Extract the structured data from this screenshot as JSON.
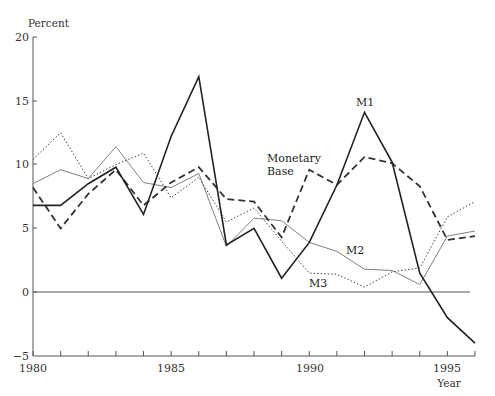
{
  "chart_data": {
    "type": "line",
    "title": "",
    "xlabel": "Year",
    "ylabel": "Percent",
    "xlim": [
      1980,
      1996
    ],
    "ylim": [
      -5,
      20
    ],
    "x_ticks": [
      1980,
      1985,
      1990,
      1995
    ],
    "y_ticks": [
      -5,
      0,
      5,
      10,
      15,
      20
    ],
    "grid": false,
    "legend": "inline labels",
    "x": [
      1980,
      1981,
      1982,
      1983,
      1984,
      1985,
      1986,
      1987,
      1988,
      1989,
      1990,
      1991,
      1992,
      1993,
      1994,
      1995,
      1996
    ],
    "series": [
      {
        "name": "M1",
        "style": "solid-thick",
        "values": [
          6.8,
          6.8,
          8.5,
          9.8,
          6.1,
          12.2,
          16.9,
          3.7,
          5.0,
          1.1,
          3.9,
          8.4,
          14.1,
          10.2,
          1.5,
          -2.0,
          -4.0
        ]
      },
      {
        "name": "M2",
        "style": "solid-thin",
        "values": [
          8.5,
          9.6,
          8.9,
          11.4,
          8.6,
          8.2,
          9.3,
          3.6,
          5.8,
          5.6,
          3.9,
          3.2,
          1.8,
          1.7,
          0.6,
          4.4,
          4.8
        ]
      },
      {
        "name": "M3",
        "style": "dotted",
        "values": [
          10.4,
          12.5,
          8.9,
          10.0,
          10.9,
          7.4,
          9.0,
          5.5,
          6.6,
          4.0,
          1.5,
          1.4,
          0.4,
          1.6,
          1.9,
          5.9,
          7.1
        ]
      },
      {
        "name": "Monetary Base",
        "style": "dashed",
        "values": [
          8.2,
          5.0,
          7.7,
          9.6,
          6.8,
          8.6,
          9.8,
          7.3,
          7.1,
          4.3,
          9.6,
          8.4,
          10.6,
          10.1,
          8.3,
          4.1,
          4.4
        ]
      }
    ],
    "annotations": [
      {
        "text": "M1",
        "x": 1992,
        "y": 15.3
      },
      {
        "text": "Monetary Base",
        "x": 1988.5,
        "y": 11.5
      },
      {
        "text": "M2",
        "x": 1991,
        "y": 3.3
      },
      {
        "text": "M3",
        "x": 1990.2,
        "y": 1.0
      }
    ],
    "reference_line": {
      "y": 0
    }
  },
  "labels": {
    "ylabel": "Percent",
    "xlabel": "Year",
    "m1": "M1",
    "m2": "M2",
    "m3": "M3",
    "mb_line1": "Monetary",
    "mb_line2": "Base",
    "y20": "20",
    "y15": "15",
    "y10": "10",
    "y5": "5",
    "y0": "0",
    "yneg5": "−5",
    "x1980": "1980",
    "x1985": "1985",
    "x1990": "1990",
    "x1995": "1995"
  },
  "colors": {
    "m1": "#222222",
    "m2": "#777777",
    "m3": "#444444",
    "mb": "#333333",
    "axis": "#555555"
  }
}
